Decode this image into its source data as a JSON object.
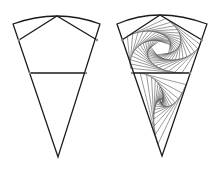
{
  "figure": {
    "width": 218,
    "height": 173,
    "background": "#ffffff",
    "stroke_color": "#1a1a1a",
    "thin_stroke_color": "#555555",
    "vertex_color": "#888888"
  },
  "panels": [
    {
      "name": "plain-wedge",
      "arc": {
        "left": [
          13,
          24
        ],
        "peak": [
          57,
          16
        ],
        "right": [
          100,
          24
        ]
      },
      "apex": [
        58,
        157
      ],
      "pentagon": [
        [
          57,
          16
        ],
        [
          97,
          40
        ],
        [
          86,
          73
        ],
        [
          30,
          73
        ],
        [
          19,
          40
        ]
      ],
      "triangle": [
        [
          30,
          73
        ],
        [
          86,
          73
        ],
        [
          58,
          157
        ]
      ],
      "spiral": false
    },
    {
      "name": "spiral-wedge",
      "arc": {
        "left": [
          117,
          24
        ],
        "peak": [
          160,
          15
        ],
        "right": [
          207,
          24
        ]
      },
      "apex": [
        162,
        156
      ],
      "pentagon": [
        [
          160,
          15
        ],
        [
          202,
          40
        ],
        [
          190,
          73
        ],
        [
          132,
          73
        ],
        [
          122,
          40
        ]
      ],
      "triangle": [
        [
          132,
          73
        ],
        [
          190,
          73
        ],
        [
          162,
          156
        ]
      ],
      "spiral": true,
      "spiral_ratio": 0.14,
      "pentagon_iterations": 16,
      "triangle_iterations": 14
    }
  ]
}
